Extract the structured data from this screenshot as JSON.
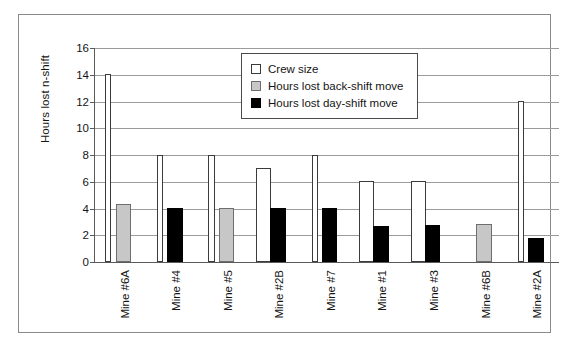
{
  "chart_data": {
    "type": "bar",
    "title": "",
    "xlabel": "",
    "ylabel": "Hours lost n-shift",
    "ylim": [
      0,
      16
    ],
    "ytick_step": 2,
    "yticks": [
      "16",
      "14",
      "12",
      "10",
      "8",
      "6",
      "4",
      "2",
      "0"
    ],
    "grid": true,
    "legend_position": "upper-center",
    "categories": [
      "Mine #6A",
      "Mine #4",
      "Mine #5",
      "Mine #2B",
      "Mine #7",
      "Mine #1",
      "Mine #3",
      "Mine #6B",
      "Mine #2A"
    ],
    "series": [
      {
        "name": "Crew size",
        "color": "#ffffff",
        "values": [
          14,
          8,
          8,
          7,
          8,
          6,
          6,
          0,
          12
        ]
      },
      {
        "name": "Hours lost back-shift move",
        "color": "#c7c7c7",
        "values": [
          4.35,
          0,
          4.0,
          0,
          0,
          0,
          0,
          2.8,
          0
        ]
      },
      {
        "name": "Hours lost day-shift move",
        "color": "#000000",
        "values": [
          0,
          4.0,
          0,
          4.0,
          4.0,
          2.7,
          2.75,
          0,
          1.75
        ]
      }
    ]
  },
  "legend": {
    "items": [
      {
        "label": "Crew size",
        "swatch": "crew"
      },
      {
        "label": "Hours lost back-shift move",
        "swatch": "back-shift"
      },
      {
        "label": "Hours lost day-shift move",
        "swatch": "day-shift"
      }
    ]
  }
}
